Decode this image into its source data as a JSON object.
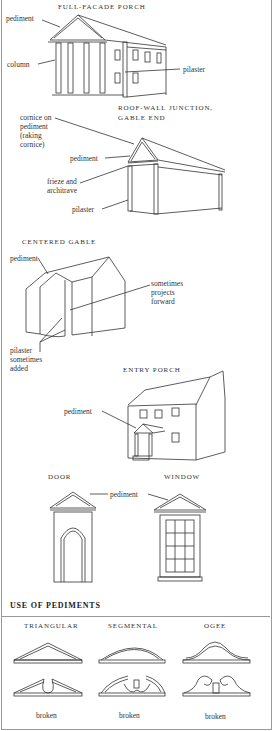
{
  "figures": {
    "full_facade_porch": {
      "title": "FULL-FACADE PORCH",
      "labels": [
        "pediment",
        "column",
        "pilaster"
      ]
    },
    "roof_wall_junction": {
      "title_line1": "ROOF-WALL JUNCTION,",
      "title_line2": "GABLE END",
      "labels": [
        "cornice on",
        "pediment",
        "(raking",
        "cornice)",
        "pediment",
        "frieze and",
        "architrave",
        "pilaster"
      ]
    },
    "centered_gable": {
      "title": "CENTERED GABLE",
      "labels": [
        "pediment",
        "sometimes",
        "projects",
        "forward",
        "pilaster",
        "sometimes",
        "added"
      ]
    },
    "entry_porch": {
      "title": "ENTRY PORCH",
      "labels": [
        "pediment"
      ]
    },
    "door": {
      "title": "DOOR"
    },
    "window": {
      "title": "WINDOW"
    },
    "door_window_label": "pediment"
  },
  "use_of_pediments": {
    "heading": "USE OF PEDIMENTS",
    "columns": [
      {
        "title": "TRIANGULAR",
        "caption": "broken"
      },
      {
        "title": "SEGMENTAL",
        "caption": "broken"
      },
      {
        "title": "OGEE",
        "caption": "broken"
      }
    ]
  }
}
